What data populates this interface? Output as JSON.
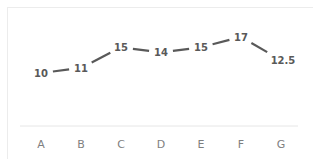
{
  "chart_data": {
    "type": "line",
    "title": "",
    "xlabel": "",
    "ylabel": "",
    "categories": [
      "A",
      "B",
      "C",
      "D",
      "E",
      "F",
      "G"
    ],
    "series": [
      {
        "name": "Series 1",
        "values": [
          10,
          11,
          15,
          14,
          15,
          17,
          12.5
        ]
      }
    ],
    "data_labels": [
      "10",
      "11",
      "15",
      "14",
      "15",
      "17",
      "12.5"
    ],
    "grid": false,
    "legend": "none",
    "y_axis_visible": false,
    "colors": {
      "line": "#595959",
      "data_label": "#595959",
      "axis_label": "#7f7f7f",
      "axis_line": "#e6e6e6",
      "border": "#ececec"
    }
  }
}
